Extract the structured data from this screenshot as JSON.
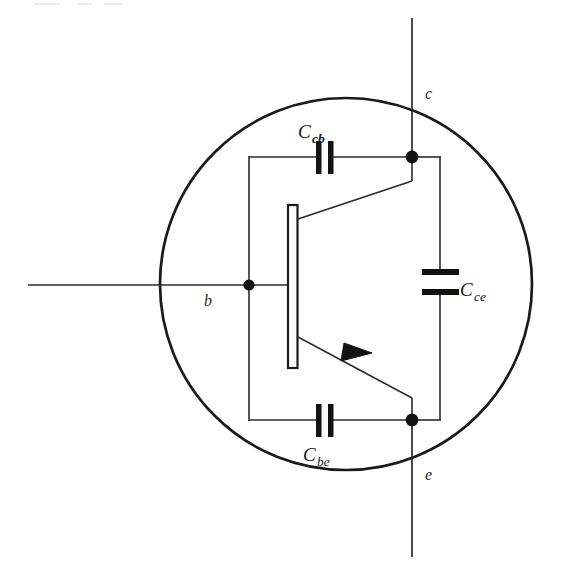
{
  "figure": {
    "name": "bjt-high-frequency-capacitance-model",
    "width": 563,
    "height": 576,
    "background_color": "#ffffff",
    "line_color": "#1a1a1a"
  },
  "terminals": [
    {
      "id": "base",
      "label": "b",
      "label_x": 204,
      "label_y": 306,
      "position": "left"
    },
    {
      "id": "collector",
      "label": "c",
      "label_x": 425,
      "label_y": 99,
      "position": "top-right"
    },
    {
      "id": "emitter",
      "label": "e",
      "label_x": 425,
      "label_y": 480,
      "position": "bottom-right"
    }
  ],
  "capacitors": [
    {
      "id": "c-cb",
      "base": "C",
      "subscript": "cb",
      "orientation": "horizontal",
      "label_x": 298,
      "label_y": 138,
      "sub_dx": 14,
      "sub_dy": 5,
      "between": [
        "base",
        "collector"
      ]
    },
    {
      "id": "c-ce",
      "base": "C",
      "subscript": "ce",
      "orientation": "vertical",
      "label_x": 460,
      "label_y": 296,
      "sub_dx": 14,
      "sub_dy": 5,
      "between": [
        "collector",
        "emitter"
      ]
    },
    {
      "id": "c-be",
      "base": "C",
      "subscript": "be",
      "orientation": "horizontal",
      "label_x": 303,
      "label_y": 461,
      "sub_dx": 14,
      "sub_dy": 5,
      "between": [
        "base",
        "emitter"
      ]
    }
  ],
  "transistor": {
    "type": "npn",
    "symbol": "bjt",
    "base_bar": {
      "x": 288,
      "y": 205,
      "width": 9,
      "height": 163
    },
    "arrow_on": "emitter"
  },
  "enclosure": {
    "shape": "circle",
    "center_x": 346,
    "center_y": 284,
    "radius": 186,
    "stroke_width": 2.6
  },
  "nodes": [
    {
      "id": "base-node",
      "x": 249,
      "y": 285,
      "radius": 5.6
    },
    {
      "id": "collector-node",
      "x": 412,
      "y": 157,
      "radius": 6.2
    },
    {
      "id": "emitter-node",
      "x": 412,
      "y": 420,
      "radius": 6.2
    }
  ]
}
